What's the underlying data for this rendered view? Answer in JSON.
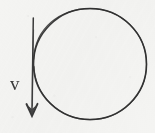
{
  "figure": {
    "background_color": "#f4f4f2",
    "stroke_color": "#3a3a3a",
    "label_color": "#3a3a3a",
    "width": 155,
    "height": 133
  },
  "circle": {
    "name": "circular-path",
    "center_x": 90,
    "center_y": 64,
    "radius": 56,
    "stroke_width": 1.6,
    "filled": false
  },
  "vector": {
    "name": "velocity-vector",
    "label": "v",
    "label_x": 10,
    "label_y": 74,
    "direction": "down",
    "start_x": 33,
    "start_y": 18,
    "end_x": 32,
    "end_y": 116,
    "arrowhead_width": 11,
    "arrowhead_length": 12,
    "stroke_width": 1.5,
    "tangent_to": "circular-path"
  }
}
